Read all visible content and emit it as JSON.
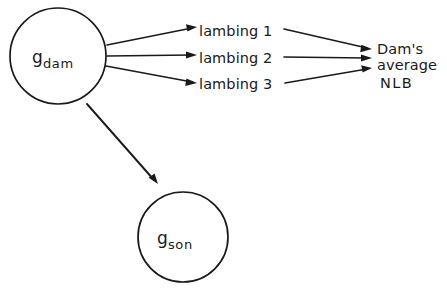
{
  "diagram": {
    "type": "path-diagram",
    "background_color": "#ffffff",
    "stroke_color": "#1a1a1a",
    "nodes": [
      {
        "id": "g-dam",
        "shape": "circle",
        "label_base": "g",
        "label_subscript": "dam",
        "cx": 58,
        "cy": 56,
        "r": 48
      },
      {
        "id": "g-son",
        "shape": "circle",
        "label_base": "g",
        "label_subscript": "son",
        "cx": 183,
        "cy": 237,
        "r": 45
      }
    ],
    "edge_labels": [
      {
        "id": "lambing-1",
        "text": "lambing 1"
      },
      {
        "id": "lambing-2",
        "text": "lambing 2"
      },
      {
        "id": "lambing-3",
        "text": "lambing 3"
      }
    ],
    "outcome": {
      "id": "dams-average-nlb",
      "line1": "Dam's",
      "line2": "average",
      "line3": "NLB",
      "full_text": "Dam's average NLB"
    },
    "caption_fragment": ""
  }
}
